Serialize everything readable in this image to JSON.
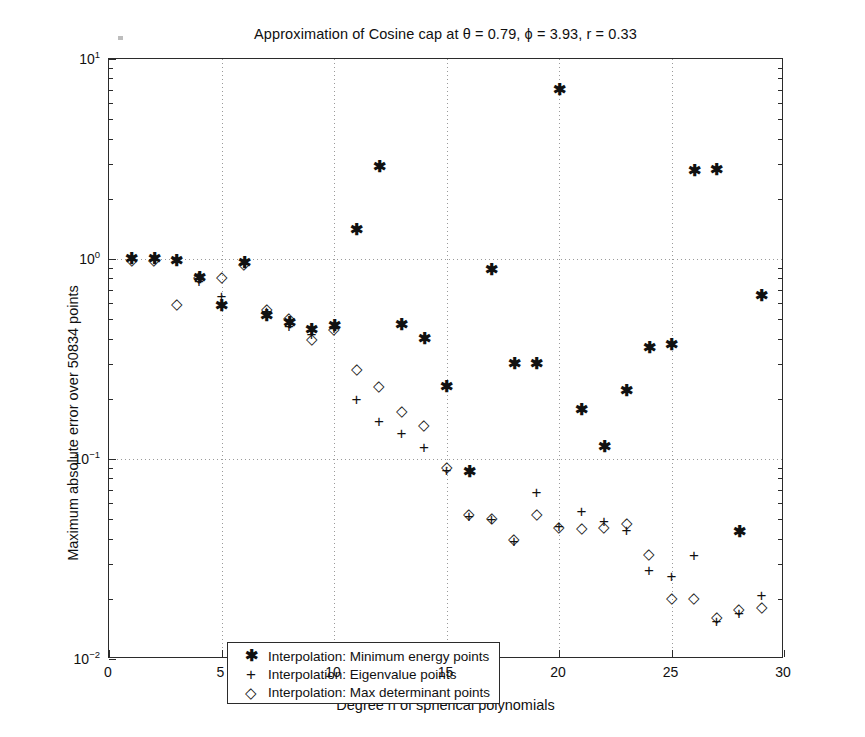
{
  "chart_data": {
    "type": "scatter",
    "title": "Approximation of Cosine cap at θ = 0.79, ϕ = 3.93, r = 0.33",
    "xlabel": "Degree n of spherical polynomials",
    "ylabel": "Maximum absolute error over 50834 points",
    "xlim": [
      0,
      30
    ],
    "ylim": [
      0.01,
      10
    ],
    "yscale": "log",
    "xscale": "linear",
    "grid": true,
    "legend_position": "lower-left",
    "xticks": [
      0,
      5,
      10,
      15,
      20,
      25,
      30
    ],
    "xticklabels": [
      "0",
      "5",
      "10",
      "15",
      "20",
      "25",
      "30"
    ],
    "yticks": [
      0.01,
      0.1,
      1,
      10
    ],
    "yticklabels": [
      "10-2",
      "10-1",
      "100",
      "101"
    ],
    "series": [
      {
        "name": "Interpolation: Minimum energy points",
        "marker": "asterisk",
        "color": "#111111",
        "x": [
          1,
          2,
          3,
          4,
          5,
          6,
          7,
          8,
          9,
          10,
          11,
          12,
          13,
          14,
          15,
          16,
          17,
          18,
          19,
          20,
          21,
          22,
          23,
          24,
          25,
          26,
          27,
          28,
          29
        ],
        "y": [
          1.0,
          1.0,
          0.98,
          0.8,
          0.58,
          0.95,
          0.52,
          0.48,
          0.44,
          0.46,
          1.4,
          2.9,
          0.47,
          0.4,
          0.23,
          0.086,
          0.88,
          0.3,
          0.3,
          7.0,
          0.175,
          0.115,
          0.22,
          0.36,
          0.37,
          2.75,
          2.8,
          0.043,
          0.65
        ]
      },
      {
        "name": "Interpolation: Eigenvalue points",
        "marker": "plus",
        "color": "#111111",
        "x": [
          1,
          2,
          3,
          4,
          5,
          6,
          7,
          8,
          9,
          10,
          11,
          12,
          13,
          14,
          15,
          16,
          17,
          18,
          19,
          20,
          21,
          22,
          23,
          24,
          25,
          26,
          27,
          28,
          29
        ],
        "y": [
          1.0,
          1.0,
          1.0,
          0.78,
          0.65,
          0.95,
          0.55,
          0.46,
          0.42,
          0.45,
          0.2,
          0.155,
          0.135,
          0.115,
          0.088,
          0.052,
          0.05,
          0.039,
          0.068,
          0.046,
          0.055,
          0.049,
          0.044,
          0.028,
          0.026,
          0.033,
          0.0155,
          0.017,
          0.021
        ]
      },
      {
        "name": "Interpolation: Max determinant points",
        "marker": "diamond",
        "color": "#111111",
        "x": [
          1,
          2,
          3,
          4,
          5,
          6,
          7,
          8,
          9,
          10,
          11,
          12,
          13,
          14,
          15,
          16,
          17,
          18,
          19,
          20,
          21,
          22,
          23,
          24,
          25,
          26,
          27,
          28,
          29
        ],
        "y": [
          1.0,
          1.0,
          0.6,
          0.82,
          0.82,
          0.96,
          0.57,
          0.51,
          0.405,
          0.45,
          0.285,
          0.235,
          0.175,
          0.15,
          0.092,
          0.054,
          0.051,
          0.0405,
          0.054,
          0.046,
          0.0455,
          0.046,
          0.0485,
          0.034,
          0.0205,
          0.0205,
          0.0165,
          0.018,
          0.0185
        ]
      }
    ]
  },
  "legend": {
    "items": [
      {
        "symbol": "✱",
        "label": "Interpolation: Minimum energy points"
      },
      {
        "symbol": "+",
        "label": "Interpolation: Eigenvalue points"
      },
      {
        "symbol": "◇",
        "label": "Interpolation: Max determinant points"
      }
    ]
  }
}
